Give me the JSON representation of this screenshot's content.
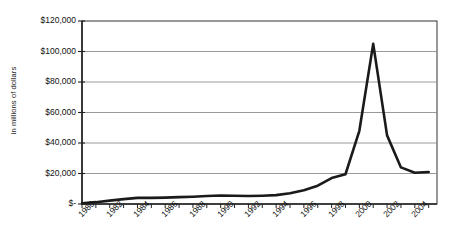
{
  "chart_data": {
    "type": "line",
    "title": "",
    "xlabel": "",
    "ylabel": "in millions of dollars",
    "x": [
      1980,
      1981,
      1982,
      1983,
      1984,
      1985,
      1986,
      1987,
      1988,
      1989,
      1990,
      1991,
      1992,
      1993,
      1994,
      1995,
      1996,
      1997,
      1998,
      1999,
      2000,
      2001,
      2002,
      2003,
      2004,
      2005
    ],
    "values": [
      500,
      1200,
      2200,
      3200,
      4000,
      4000,
      4200,
      4500,
      4800,
      5200,
      5600,
      5400,
      5200,
      5400,
      5800,
      7000,
      9000,
      12000,
      17000,
      19500,
      48000,
      105000,
      45000,
      24000,
      20500,
      21000
    ],
    "tick_labels_x": [
      "1980",
      "1982",
      "1984",
      "1986",
      "1988",
      "1990",
      "1992",
      "1994",
      "1996",
      "1998",
      "2000",
      "2002",
      "2004"
    ],
    "tick_labels_y": [
      "$120,000",
      "$100,000",
      "$80,000",
      "$60,000",
      "$40,000",
      "$20,000",
      "$-"
    ],
    "ylim": [
      0,
      120000
    ],
    "xlim": [
      1980,
      2005.6
    ],
    "grid": true,
    "legend": "none",
    "series_color": "#1a1a1a",
    "grid_color": "#808080",
    "axis_color": "#333333"
  }
}
